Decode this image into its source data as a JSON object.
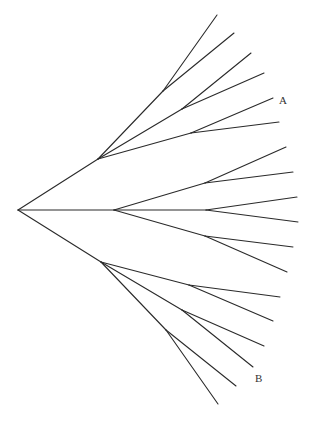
{
  "diagram": {
    "type": "tree",
    "stroke_color": "#2a2a2a",
    "labels": [
      {
        "id": "A",
        "text": "A",
        "x": 279,
        "y": 104
      },
      {
        "id": "B",
        "text": "B",
        "x": 255,
        "y": 382
      }
    ],
    "edges": [
      {
        "from": [
          18,
          210
        ],
        "to": [
          98,
          159
        ]
      },
      {
        "from": [
          18,
          210
        ],
        "to": [
          114,
          210
        ]
      },
      {
        "from": [
          18,
          210
        ],
        "to": [
          101,
          262
        ]
      },
      {
        "from": [
          98,
          159
        ],
        "to": [
          163,
          91
        ]
      },
      {
        "from": [
          163,
          91
        ],
        "to": [
          217,
          15
        ]
      },
      {
        "from": [
          163,
          91
        ],
        "to": [
          234,
          33
        ]
      },
      {
        "from": [
          98,
          159
        ],
        "to": [
          182,
          109
        ]
      },
      {
        "from": [
          182,
          109
        ],
        "to": [
          251,
          53
        ]
      },
      {
        "from": [
          182,
          109
        ],
        "to": [
          264,
          73
        ]
      },
      {
        "from": [
          98,
          159
        ],
        "to": [
          191,
          133
        ]
      },
      {
        "from": [
          191,
          133
        ],
        "to": [
          273,
          98
        ]
      },
      {
        "from": [
          191,
          133
        ],
        "to": [
          279,
          122
        ]
      },
      {
        "from": [
          114,
          210
        ],
        "to": [
          205,
          183
        ]
      },
      {
        "from": [
          205,
          183
        ],
        "to": [
          286,
          147
        ]
      },
      {
        "from": [
          205,
          183
        ],
        "to": [
          293,
          172
        ]
      },
      {
        "from": [
          114,
          210
        ],
        "to": [
          206,
          210
        ]
      },
      {
        "from": [
          206,
          210
        ],
        "to": [
          297,
          197
        ]
      },
      {
        "from": [
          206,
          210
        ],
        "to": [
          298,
          222
        ]
      },
      {
        "from": [
          114,
          210
        ],
        "to": [
          205,
          236
        ]
      },
      {
        "from": [
          205,
          236
        ],
        "to": [
          293,
          247
        ]
      },
      {
        "from": [
          205,
          236
        ],
        "to": [
          287,
          272
        ]
      },
      {
        "from": [
          101,
          262
        ],
        "to": [
          189,
          285
        ]
      },
      {
        "from": [
          189,
          285
        ],
        "to": [
          280,
          297
        ]
      },
      {
        "from": [
          189,
          285
        ],
        "to": [
          273,
          321
        ]
      },
      {
        "from": [
          101,
          262
        ],
        "to": [
          182,
          310
        ]
      },
      {
        "from": [
          182,
          310
        ],
        "to": [
          264,
          346
        ]
      },
      {
        "from": [
          182,
          310
        ],
        "to": [
          253,
          367
        ]
      },
      {
        "from": [
          101,
          262
        ],
        "to": [
          166,
          330
        ]
      },
      {
        "from": [
          166,
          330
        ],
        "to": [
          236,
          386
        ]
      },
      {
        "from": [
          166,
          330
        ],
        "to": [
          218,
          404
        ]
      }
    ]
  }
}
